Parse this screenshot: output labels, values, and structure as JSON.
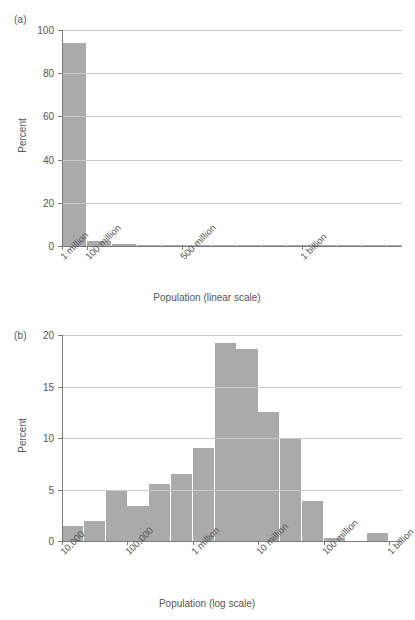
{
  "figure": {
    "background": "#ffffff",
    "bar_color": "#aaaaaa",
    "axis_color": "#7a7a7a",
    "grid_color": "#c9c9c9",
    "text_color": "#555555"
  },
  "panel_a": {
    "label": "(a)",
    "ylabel": "Percent",
    "xlabel": "Population (linear scale)",
    "ytick_labels": [
      "0",
      "20",
      "40",
      "60",
      "80",
      "100"
    ],
    "xtick_labels": [
      "1 million",
      "100 million",
      "500 million",
      "1 billion"
    ]
  },
  "panel_b": {
    "label": "(b)",
    "ylabel": "Percent",
    "xlabel": "Population (log scale)",
    "ytick_labels": [
      "0",
      "5",
      "10",
      "15",
      "20"
    ],
    "xtick_labels": [
      "10,000",
      "100,000",
      "1 million",
      "10 million",
      "100 million",
      "1 billion"
    ]
  },
  "chart_data": [
    {
      "type": "bar",
      "title": "(a)",
      "xlabel": "Population (linear scale)",
      "ylabel": "Percent",
      "ylim": [
        0,
        100
      ],
      "yticks": [
        0,
        20,
        40,
        60,
        80,
        100
      ],
      "grid": true,
      "legend": "none",
      "xticks": [
        {
          "label": "1 million",
          "pos_frac": 0.0
        },
        {
          "label": "100 million",
          "pos_frac": 0.0735
        },
        {
          "label": "500 million",
          "pos_frac": 0.3529
        },
        {
          "label": "1 billion",
          "pos_frac": 0.7059
        }
      ],
      "bins": [
        {
          "left_frac": 0.0,
          "right_frac": 0.0735,
          "value": 94.0
        },
        {
          "left_frac": 0.0735,
          "right_frac": 0.1471,
          "value": 2.5
        },
        {
          "left_frac": 0.1471,
          "right_frac": 0.2206,
          "value": 0.8
        },
        {
          "left_frac": 0.2206,
          "right_frac": 0.2941,
          "value": 0.35
        },
        {
          "left_frac": 0.2941,
          "right_frac": 0.3676,
          "value": 0.2
        },
        {
          "left_frac": 0.3676,
          "right_frac": 0.4412,
          "value": 0.15
        },
        {
          "left_frac": 0.4412,
          "right_frac": 0.5147,
          "value": 0.1
        },
        {
          "left_frac": 0.5147,
          "right_frac": 0.5882,
          "value": 0.1
        },
        {
          "left_frac": 0.5882,
          "right_frac": 0.6618,
          "value": 0.05
        },
        {
          "left_frac": 0.6618,
          "right_frac": 0.7353,
          "value": 0.05
        },
        {
          "left_frac": 0.7353,
          "right_frac": 0.8088,
          "value": 0.2
        },
        {
          "left_frac": 0.8088,
          "right_frac": 0.8824,
          "value": 0.1
        },
        {
          "left_frac": 0.8824,
          "right_frac": 0.9559,
          "value": 0.05
        },
        {
          "left_frac": 0.9559,
          "right_frac": 1.0,
          "value": 0.05
        }
      ]
    },
    {
      "type": "bar",
      "title": "(b)",
      "xlabel": "Population (log scale)",
      "ylabel": "Percent",
      "ylim": [
        0,
        20
      ],
      "yticks": [
        0,
        5,
        10,
        15,
        20
      ],
      "grid": true,
      "legend": "none",
      "xticks": [
        {
          "label": "10,000",
          "pos_frac": 0.0
        },
        {
          "label": "100,000",
          "pos_frac": 0.1923
        },
        {
          "label": "1 million",
          "pos_frac": 0.3846
        },
        {
          "label": "10 million",
          "pos_frac": 0.5769
        },
        {
          "label": "100 million",
          "pos_frac": 0.7692
        },
        {
          "label": "1 billion",
          "pos_frac": 0.9615
        }
      ],
      "categories": [
        "10,000-31,600",
        "31,600-100,000",
        "100,000-316,000",
        "316,000-1M",
        "1M-3.16M",
        "3.16M-10M",
        "10M-31.6M",
        "31.6M-100M",
        "100M-316M",
        "316M-1B",
        "1B-3.16B",
        "3.16B-10B",
        "10B-31.6B",
        "31.6B-100B"
      ],
      "bins": [
        {
          "left_frac": 0.0,
          "right_frac": 0.0641,
          "value": 1.5
        },
        {
          "left_frac": 0.0641,
          "right_frac": 0.1282,
          "value": 1.9
        },
        {
          "left_frac": 0.1282,
          "right_frac": 0.1923,
          "value": 4.9
        },
        {
          "left_frac": 0.1923,
          "right_frac": 0.2564,
          "value": 3.4
        },
        {
          "left_frac": 0.2564,
          "right_frac": 0.3205,
          "value": 5.5
        },
        {
          "left_frac": 0.3205,
          "right_frac": 0.3846,
          "value": 6.5
        },
        {
          "left_frac": 0.3846,
          "right_frac": 0.4487,
          "value": 9.0
        },
        {
          "left_frac": 0.4487,
          "right_frac": 0.5128,
          "value": 19.2
        },
        {
          "left_frac": 0.5128,
          "right_frac": 0.5769,
          "value": 18.6
        },
        {
          "left_frac": 0.5769,
          "right_frac": 0.641,
          "value": 12.5
        },
        {
          "left_frac": 0.641,
          "right_frac": 0.7051,
          "value": 10.0
        },
        {
          "left_frac": 0.7051,
          "right_frac": 0.7692,
          "value": 3.9
        },
        {
          "left_frac": 0.7692,
          "right_frac": 0.8333,
          "value": 0.3
        },
        {
          "left_frac": 0.8974,
          "right_frac": 0.9615,
          "value": 0.8
        }
      ],
      "values": [
        1.5,
        1.9,
        4.9,
        3.4,
        5.5,
        6.5,
        9.0,
        19.2,
        18.6,
        12.5,
        10.0,
        3.9,
        0.3,
        0.8
      ]
    }
  ]
}
